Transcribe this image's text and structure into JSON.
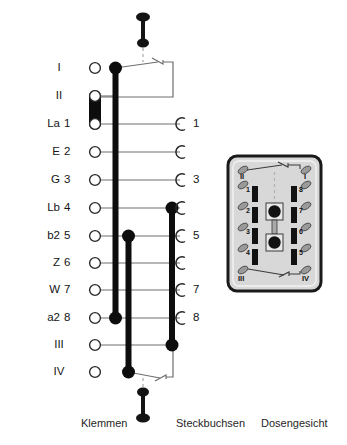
{
  "figure": {
    "captions": {
      "terminals": "Klemmen",
      "sockets": "Steckbuchsen",
      "socket_face": "Dosengesicht"
    }
  },
  "colors": {
    "ink": "#141414",
    "wire": "#6e6e6e",
    "bus": "#0d0d0d",
    "face_fill": "#d8d8d8",
    "face_border": "#1a1a1a",
    "contact_fill": "#8a8a8a",
    "dashed": "#b0b0b0"
  },
  "terminal_rows": [
    {
      "name": "",
      "num": "I",
      "socket": "",
      "y": 68
    },
    {
      "name": "",
      "num": "II",
      "socket": "",
      "y": 96
    },
    {
      "name": "La",
      "num": "1",
      "socket": "1",
      "y": 124
    },
    {
      "name": "E",
      "num": "2",
      "socket": "",
      "y": 152
    },
    {
      "name": "G",
      "num": "3",
      "socket": "3",
      "y": 180
    },
    {
      "name": "Lb",
      "num": "4",
      "socket": "",
      "y": 208
    },
    {
      "name": "b2",
      "num": "5",
      "socket": "5",
      "y": 236
    },
    {
      "name": "Z",
      "num": "6",
      "socket": "",
      "y": 263
    },
    {
      "name": "W",
      "num": "7",
      "socket": "7",
      "y": 290
    },
    {
      "name": "a2",
      "num": "8",
      "socket": "8",
      "y": 318
    },
    {
      "name": "",
      "num": "III",
      "socket": "",
      "y": 345
    },
    {
      "name": "",
      "num": "IV",
      "socket": "",
      "y": 372
    }
  ],
  "socket_face": {
    "corner_labels": {
      "top_left": "II",
      "top_right": "I",
      "bottom_left": "III",
      "bottom_right": "IV"
    },
    "left_column_numbers": [
      "1",
      "2",
      "3",
      "4"
    ],
    "right_column_numbers": [
      "8",
      "7",
      "6",
      "5"
    ]
  }
}
